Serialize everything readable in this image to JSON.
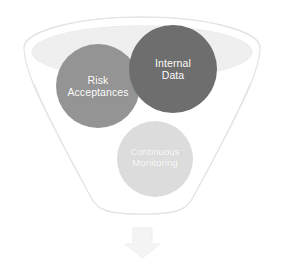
{
  "diagram": {
    "type": "funnel-with-bubbles",
    "title": "",
    "background_color": "#ffffff",
    "funnel": {
      "name": "funnel",
      "outline_color": "#e3e3e3",
      "rim_fill_color": "#f7f7f7",
      "bowl_fill_color": "#efefef",
      "body_fill_color": "#ffffff"
    },
    "bubbles": [
      {
        "id": "risk-acceptances",
        "line1": "Risk",
        "line2": "Acceptances",
        "color": "#949494",
        "text_color": "#ffffff",
        "cx": 98,
        "cy": 86,
        "r": 42
      },
      {
        "id": "internal-data",
        "line1": "Internal",
        "line2": "Data",
        "color": "#6e6e6e",
        "text_color": "#ffffff",
        "cx": 173,
        "cy": 69,
        "r": 44
      },
      {
        "id": "continuous-monitoring",
        "line1": "Continuous",
        "line2": "Monitoring",
        "color": "#dcdcdc",
        "text_color": "#ffffff",
        "cx": 155,
        "cy": 159,
        "r": 38
      }
    ],
    "arrow": {
      "id": "output-arrow",
      "direction": "down",
      "color": "#f4f4f4",
      "outline_color": "#ededed"
    },
    "watermark": ""
  }
}
